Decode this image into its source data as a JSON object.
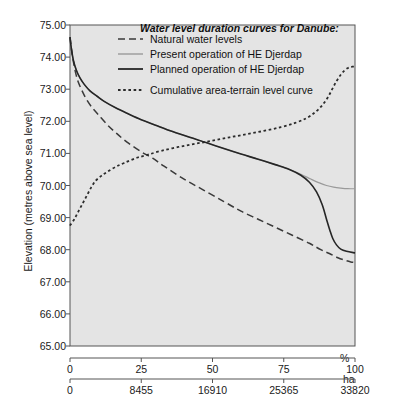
{
  "chart_data": {
    "type": "line",
    "title": "Water level duration curves for Danube:",
    "ylabel": "Elevation (metres above sea level)",
    "ylim": [
      65.0,
      75.0
    ],
    "yticks": [
      "65.00",
      "66.00",
      "67.00",
      "68.00",
      "69.00",
      "70.00",
      "71.00",
      "72.00",
      "73.00",
      "74.00",
      "75.00"
    ],
    "ytick_values": [
      65,
      66,
      67,
      68,
      69,
      70,
      71,
      72,
      73,
      74,
      75
    ],
    "xlim": [
      0,
      100
    ],
    "xaxis_primary": {
      "unit": "%",
      "ticks": [
        "0",
        "25",
        "50",
        "75",
        "100"
      ],
      "tick_values": [
        0,
        25,
        50,
        75,
        100
      ]
    },
    "xaxis_secondary": {
      "unit": "ha",
      "ticks": [
        "0",
        "8455",
        "16910",
        "25365",
        "33820"
      ],
      "tick_values": [
        0,
        8455,
        16910,
        25365,
        33820
      ]
    },
    "grid": false,
    "legend_position": "top-center-inside",
    "plot_background": "#e4e4e4",
    "series": [
      {
        "name": "Natural water levels",
        "style": "dashed",
        "color": "#3a3a3a",
        "points": [
          [
            0.0,
            74.62
          ],
          [
            0.6,
            74.2
          ],
          [
            1.2,
            73.85
          ],
          [
            2.0,
            73.5
          ],
          [
            3.0,
            73.2
          ],
          [
            4.5,
            72.9
          ],
          [
            6.0,
            72.65
          ],
          [
            8.0,
            72.4
          ],
          [
            10.0,
            72.2
          ],
          [
            13.0,
            71.9
          ],
          [
            16.0,
            71.65
          ],
          [
            20.0,
            71.35
          ],
          [
            25.0,
            71.05
          ],
          [
            29.0,
            70.85
          ],
          [
            33.0,
            70.6
          ],
          [
            40.0,
            70.2
          ],
          [
            47.0,
            69.85
          ],
          [
            54.0,
            69.5
          ],
          [
            60.0,
            69.2
          ],
          [
            66.0,
            68.95
          ],
          [
            72.0,
            68.7
          ],
          [
            78.0,
            68.45
          ],
          [
            84.0,
            68.2
          ],
          [
            88.0,
            68.0
          ],
          [
            91.0,
            67.88
          ],
          [
            94.0,
            67.75
          ],
          [
            96.5,
            67.67
          ],
          [
            98.5,
            67.62
          ],
          [
            100.0,
            67.6
          ]
        ]
      },
      {
        "name": "Present operation of HE Djerdap",
        "style": "solid-light",
        "color": "#9a9a9a",
        "points": [
          [
            0.0,
            74.62
          ],
          [
            0.5,
            74.25
          ],
          [
            1.2,
            73.9
          ],
          [
            2.2,
            73.6
          ],
          [
            3.5,
            73.35
          ],
          [
            5.0,
            73.15
          ],
          [
            7.0,
            72.95
          ],
          [
            9.5,
            72.78
          ],
          [
            12.0,
            72.62
          ],
          [
            16.0,
            72.42
          ],
          [
            20.0,
            72.25
          ],
          [
            25.0,
            72.05
          ],
          [
            30.0,
            71.88
          ],
          [
            36.0,
            71.68
          ],
          [
            42.0,
            71.5
          ],
          [
            48.0,
            71.33
          ],
          [
            54.0,
            71.15
          ],
          [
            60.0,
            70.98
          ],
          [
            66.0,
            70.82
          ],
          [
            72.0,
            70.65
          ],
          [
            77.0,
            70.5
          ],
          [
            81.0,
            70.35
          ],
          [
            84.5,
            70.2
          ],
          [
            87.5,
            70.08
          ],
          [
            90.0,
            70.0
          ],
          [
            92.5,
            69.95
          ],
          [
            95.0,
            69.92
          ],
          [
            97.5,
            69.9
          ],
          [
            100.0,
            69.9
          ]
        ]
      },
      {
        "name": "Planned operation of HE Djerdap",
        "style": "solid-dark",
        "color": "#262626",
        "points": [
          [
            0.0,
            74.62
          ],
          [
            0.5,
            74.25
          ],
          [
            1.2,
            73.9
          ],
          [
            2.2,
            73.6
          ],
          [
            3.5,
            73.35
          ],
          [
            5.0,
            73.15
          ],
          [
            7.0,
            72.95
          ],
          [
            9.5,
            72.78
          ],
          [
            12.0,
            72.62
          ],
          [
            16.0,
            72.42
          ],
          [
            20.0,
            72.25
          ],
          [
            25.0,
            72.05
          ],
          [
            30.0,
            71.88
          ],
          [
            36.0,
            71.68
          ],
          [
            42.0,
            71.5
          ],
          [
            48.0,
            71.33
          ],
          [
            54.0,
            71.15
          ],
          [
            60.0,
            70.98
          ],
          [
            66.0,
            70.82
          ],
          [
            72.0,
            70.65
          ],
          [
            77.0,
            70.5
          ],
          [
            81.0,
            70.32
          ],
          [
            84.0,
            70.1
          ],
          [
            86.5,
            69.8
          ],
          [
            88.5,
            69.4
          ],
          [
            90.0,
            68.95
          ],
          [
            91.2,
            68.6
          ],
          [
            92.2,
            68.35
          ],
          [
            93.5,
            68.15
          ],
          [
            95.0,
            68.02
          ],
          [
            97.0,
            67.95
          ],
          [
            100.0,
            67.9
          ]
        ]
      },
      {
        "name": "Cumulative area-terrain level curve",
        "style": "dotted",
        "color": "#2b2b2b",
        "points": [
          [
            0.0,
            68.75
          ],
          [
            1.5,
            68.95
          ],
          [
            3.0,
            69.2
          ],
          [
            4.5,
            69.45
          ],
          [
            6.0,
            69.7
          ],
          [
            7.5,
            69.95
          ],
          [
            9.0,
            70.15
          ],
          [
            11.0,
            70.3
          ],
          [
            13.0,
            70.42
          ],
          [
            16.0,
            70.58
          ],
          [
            19.0,
            70.7
          ],
          [
            23.0,
            70.85
          ],
          [
            27.0,
            70.95
          ],
          [
            32.0,
            71.08
          ],
          [
            38.0,
            71.2
          ],
          [
            44.0,
            71.3
          ],
          [
            50.0,
            71.4
          ],
          [
            56.0,
            71.5
          ],
          [
            62.0,
            71.6
          ],
          [
            68.0,
            71.7
          ],
          [
            74.0,
            71.82
          ],
          [
            79.0,
            71.95
          ],
          [
            83.0,
            72.1
          ],
          [
            86.0,
            72.28
          ],
          [
            88.5,
            72.5
          ],
          [
            90.5,
            72.75
          ],
          [
            92.0,
            73.0
          ],
          [
            93.5,
            73.25
          ],
          [
            95.0,
            73.45
          ],
          [
            96.5,
            73.6
          ],
          [
            98.0,
            73.68
          ],
          [
            99.0,
            73.7
          ],
          [
            100.0,
            73.7
          ]
        ]
      }
    ]
  },
  "legend": {
    "title": "Water level duration curves for Danube:",
    "entries": [
      {
        "label": "Natural water levels",
        "swatch": "dashed"
      },
      {
        "label": "Present operation of HE Djerdap",
        "swatch": "solid-light"
      },
      {
        "label": "Planned operation of HE Djerdap",
        "swatch": "solid-dark"
      },
      {
        "label": "Cumulative area-terrain level curve",
        "swatch": "dotted"
      }
    ]
  },
  "axes": {
    "y_title": "Elevation (metres above sea level)",
    "x_percent_unit": "%",
    "x_hectare_unit": "ha"
  }
}
